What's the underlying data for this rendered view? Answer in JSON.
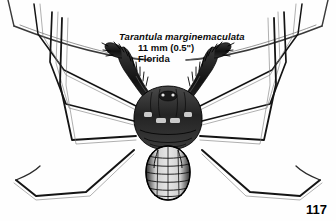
{
  "page": {
    "page_number": "117",
    "background_color": "#fefefe",
    "ink_color": "#111111"
  },
  "figure": {
    "caption": {
      "species_name": "Tarantula  marginemaculata",
      "size": "11 mm (0.5\")",
      "locality": "Florida"
    },
    "parts": {
      "carapace": "carapace",
      "abdomen": "segmented-abdomen",
      "pedipalp_left": "left-spiny-pedipalp",
      "pedipalp_right": "right-spiny-pedipalp",
      "antenniform_leg_left": "left-antenniform-leg",
      "antenniform_leg_right": "right-antenniform-leg",
      "walking_legs": "walking-legs"
    }
  },
  "top_cut_text": "single family, Tarantulidae"
}
